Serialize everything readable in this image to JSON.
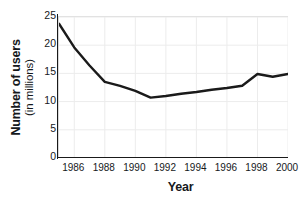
{
  "chart_data": {
    "type": "line",
    "title": "",
    "xlabel": "Year",
    "ylabel": "Number of users (in millions)",
    "ylabel_line1": "Number of users",
    "ylabel_line2": "(in millions)",
    "xlim": [
      1985,
      2000
    ],
    "ylim": [
      0,
      25
    ],
    "yticks": [
      0,
      5,
      10,
      15,
      20,
      25
    ],
    "ytick_labels": [
      "0",
      "5",
      "10",
      "15",
      "20",
      "25"
    ],
    "xticks": [
      1986,
      1988,
      1990,
      1992,
      1994,
      1996,
      1998,
      2000
    ],
    "xtick_labels": [
      "1986",
      "1988",
      "1990",
      "1992",
      "1994",
      "1996",
      "1998",
      "2000"
    ],
    "grid": true,
    "grid_color": "#ececec",
    "legend": "none",
    "line_color": "#1a1a1a",
    "line_width": 2.4,
    "x": [
      1985,
      1986,
      1987,
      1988,
      1989,
      1990,
      1991,
      1992,
      1993,
      1994,
      1995,
      1996,
      1997,
      1998,
      1999,
      2000
    ],
    "values": [
      23.8,
      19.6,
      16.4,
      13.5,
      12.8,
      11.9,
      10.7,
      11.0,
      11.4,
      11.7,
      12.1,
      12.4,
      12.8,
      14.9,
      14.4,
      14.9
    ],
    "series": [
      {
        "name": "Number of users",
        "values": [
          23.8,
          19.6,
          16.4,
          13.5,
          12.8,
          11.9,
          10.7,
          11.0,
          11.4,
          11.7,
          12.1,
          12.4,
          12.8,
          14.9,
          14.4,
          14.9
        ]
      }
    ]
  }
}
